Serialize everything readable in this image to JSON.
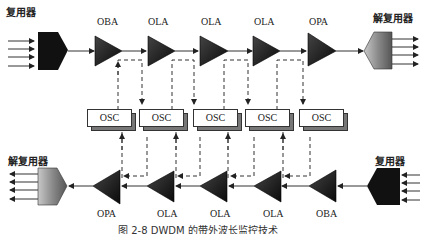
{
  "diagram": {
    "top_row": {
      "left_label": "复用器",
      "right_label": "解复用器",
      "amplifiers": [
        "OBA",
        "OLA",
        "OLA",
        "OLA",
        "OPA"
      ]
    },
    "osc_row": {
      "boxes": [
        "OSC",
        "OSC",
        "OSC",
        "OSC",
        "OSC"
      ]
    },
    "bottom_row": {
      "left_label": "解复用器",
      "right_label": "复用器",
      "amplifiers": [
        "OPA",
        "OLA",
        "OLA",
        "OLA",
        "OBA"
      ]
    },
    "caption": "图 2-8   DWDM 的带外波长监控技术",
    "colors": {
      "multiplexer": "#111111",
      "demultiplexer": "#8a8a8a",
      "amplifier": "#1a1a1a",
      "line": "#333333",
      "osc_shadow": "#777777"
    }
  }
}
